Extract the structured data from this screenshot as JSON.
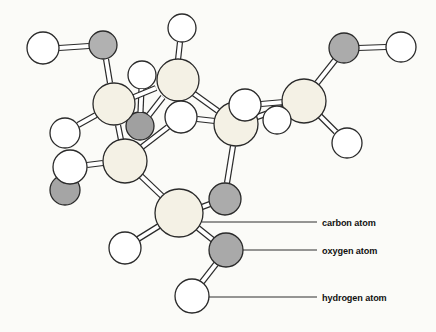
{
  "figure": {
    "kind": "ball-and-stick molecular model",
    "canvas": {
      "width": 436,
      "height": 332,
      "background": "#fbfbf8"
    }
  },
  "style": {
    "outline": "#2a2a2a",
    "circle_stroke_width": 1.3,
    "bond_outer_width": 6.2,
    "bond_inner_width": 3.8,
    "bond_fill": "#ffffff",
    "leader_color": "#2e2e2e",
    "leader_width": 1,
    "element_fills": {
      "carbon": "#f4f1e5",
      "oxygen": "#adadad",
      "hydrogen": "#ffffff"
    }
  },
  "atoms_back": [
    {
      "id": "H-4",
      "element": "hydrogen",
      "x": 142,
      "y": 75,
      "r": 14
    },
    {
      "id": "O-3",
      "element": "oxygen",
      "x": 140,
      "y": 126,
      "r": 14,
      "fill": "#a0a0a0"
    }
  ],
  "bonds": [
    {
      "from": "C-2",
      "to": "O-3",
      "x1": 163,
      "y1": 97,
      "x2": 149,
      "y2": 115
    },
    {
      "from": "H-4",
      "to": "O-3",
      "x1": 141.5,
      "y1": 89,
      "x2": 140.5,
      "y2": 112
    },
    {
      "from": "H-1",
      "to": "O-1",
      "x1": 59,
      "y1": 48,
      "x2": 89,
      "y2": 46
    },
    {
      "from": "O-1",
      "to": "C-1",
      "x1": 106,
      "y1": 59,
      "x2": 110,
      "y2": 83
    },
    {
      "from": "C-1",
      "to": "H-5",
      "x1": 96,
      "y1": 115,
      "x2": 78,
      "y2": 125
    },
    {
      "from": "C-1",
      "to": "C-2",
      "x1": 134,
      "y1": 97,
      "x2": 156,
      "y2": 88
    },
    {
      "from": "C-1",
      "to": "C-3",
      "x1": 118,
      "y1": 125,
      "x2": 121,
      "y2": 140
    },
    {
      "from": "C-2",
      "to": "H-2",
      "x1": 178,
      "y1": 60,
      "x2": 180,
      "y2": 42
    },
    {
      "from": "C-2",
      "to": "C-4",
      "x1": 193,
      "y1": 93,
      "x2": 218,
      "y2": 111
    },
    {
      "from": "C-3",
      "to": "H-6",
      "x1": 103,
      "y1": 163,
      "x2": 87,
      "y2": 165
    },
    {
      "from": "C-3",
      "to": "H-12",
      "x1": 142,
      "y1": 147,
      "x2": 168,
      "y2": 127
    },
    {
      "from": "H-12",
      "to": "C-4",
      "x1": 197,
      "y1": 119,
      "x2": 215,
      "y2": 121
    },
    {
      "from": "C-3",
      "to": "C-6",
      "x1": 141,
      "y1": 176,
      "x2": 162,
      "y2": 196
    },
    {
      "from": "C-4",
      "to": "O-4",
      "x1": 233,
      "y1": 146,
      "x2": 227,
      "y2": 183
    },
    {
      "from": "O-4",
      "to": "C-6",
      "x1": 210,
      "y1": 204,
      "x2": 202,
      "y2": 207
    },
    {
      "from": "C-4",
      "to": "C-5",
      "x1": 257,
      "y1": 117,
      "x2": 283,
      "y2": 108
    },
    {
      "from": "H-7",
      "to": "C-5",
      "x1": 261,
      "y1": 104,
      "x2": 284,
      "y2": 102
    },
    {
      "from": "C-5",
      "to": "O-2",
      "x1": 317,
      "y1": 83,
      "x2": 336,
      "y2": 59
    },
    {
      "from": "O-2",
      "to": "H-3",
      "x1": 358,
      "y1": 48,
      "x2": 386,
      "y2": 47
    },
    {
      "from": "C-5",
      "to": "H-9",
      "x1": 320,
      "y1": 116,
      "x2": 336,
      "y2": 132
    },
    {
      "from": "C-6",
      "to": "H-10",
      "x1": 159,
      "y1": 226,
      "x2": 138,
      "y2": 239
    },
    {
      "from": "C-6",
      "to": "O-5",
      "x1": 198,
      "y1": 228,
      "x2": 213,
      "y2": 240
    },
    {
      "from": "O-5",
      "to": "H-11",
      "x1": 216,
      "y1": 264,
      "x2": 202,
      "y2": 282
    }
  ],
  "atoms": [
    {
      "id": "O-6",
      "element": "oxygen",
      "x": 65,
      "y": 190,
      "r": 15,
      "fill": "#a5a5a5"
    },
    {
      "id": "H-6",
      "element": "hydrogen",
      "x": 70,
      "y": 167,
      "r": 17
    },
    {
      "id": "H-5",
      "element": "hydrogen",
      "x": 65,
      "y": 133,
      "r": 15
    },
    {
      "id": "O-1",
      "element": "oxygen",
      "x": 103,
      "y": 45,
      "r": 14,
      "fill": "#b1b1b1"
    },
    {
      "id": "H-1",
      "element": "hydrogen",
      "x": 43,
      "y": 48,
      "r": 16
    },
    {
      "id": "H-2",
      "element": "hydrogen",
      "x": 182,
      "y": 28,
      "r": 14
    },
    {
      "id": "C-1",
      "element": "carbon",
      "x": 114,
      "y": 104,
      "r": 21
    },
    {
      "id": "C-2",
      "element": "carbon",
      "x": 178,
      "y": 80,
      "r": 21
    },
    {
      "id": "C-3",
      "element": "carbon",
      "x": 125,
      "y": 161,
      "r": 22
    },
    {
      "id": "H-12",
      "element": "hydrogen",
      "x": 181,
      "y": 117,
      "r": 16
    },
    {
      "id": "C-4",
      "element": "carbon",
      "x": 236,
      "y": 124,
      "r": 22
    },
    {
      "id": "H-7",
      "element": "hydrogen",
      "x": 245,
      "y": 105,
      "r": 16
    },
    {
      "id": "C-5",
      "element": "carbon",
      "x": 304,
      "y": 101,
      "r": 22
    },
    {
      "id": "H-8",
      "element": "hydrogen",
      "x": 277,
      "y": 120,
      "r": 14
    },
    {
      "id": "O-2",
      "element": "oxygen",
      "x": 344,
      "y": 48,
      "r": 15,
      "fill": "#ababab"
    },
    {
      "id": "H-3",
      "element": "hydrogen",
      "x": 401,
      "y": 47,
      "r": 15
    },
    {
      "id": "H-9",
      "element": "hydrogen",
      "x": 347,
      "y": 143,
      "r": 15
    },
    {
      "id": "O-4",
      "element": "oxygen",
      "x": 225,
      "y": 199,
      "r": 16,
      "fill": "#ababab"
    },
    {
      "id": "C-6",
      "element": "carbon",
      "x": 179,
      "y": 213,
      "r": 24
    },
    {
      "id": "H-10",
      "element": "hydrogen",
      "x": 125,
      "y": 248,
      "r": 16
    },
    {
      "id": "O-5",
      "element": "oxygen",
      "x": 226,
      "y": 250,
      "r": 17,
      "fill": "#a9a9a9"
    },
    {
      "id": "H-11",
      "element": "hydrogen",
      "x": 192,
      "y": 296,
      "r": 17
    }
  ],
  "labels": [
    {
      "text": "carbon atom",
      "line": {
        "x1": 202,
        "y1": 222,
        "x2": 317,
        "y2": 222
      },
      "text_x": 322,
      "text_y": 222
    },
    {
      "text": "oxygen atom",
      "line": {
        "x1": 243,
        "y1": 250,
        "x2": 317,
        "y2": 250
      },
      "text_x": 322,
      "text_y": 250
    },
    {
      "text": "hydrogen atom",
      "line": {
        "x1": 209,
        "y1": 297,
        "x2": 317,
        "y2": 297
      },
      "text_x": 322,
      "text_y": 297
    }
  ]
}
